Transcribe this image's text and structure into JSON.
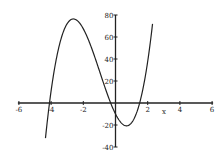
{
  "chart_data": {
    "type": "line",
    "title": "",
    "xlabel": "x",
    "ylabel": "",
    "xlim": [
      -6,
      6
    ],
    "ylim": [
      -40,
      80
    ],
    "grid": false,
    "legend": null,
    "x_ticks": [
      "-6",
      "-4",
      "-2",
      "0",
      "2",
      "4",
      "6"
    ],
    "y_ticks": [
      "-40",
      "-20",
      "20",
      "40",
      "60",
      "80"
    ],
    "series": [
      {
        "name": "f(x)",
        "description": "cubic with roots near x=-4.1, -0.3, 1.5; local max ~78 at x~-2.5; local min ~-23 at x~0.7",
        "x": [
          -4.35,
          -4.1,
          -3.5,
          -3.0,
          -2.5,
          -2.0,
          -1.5,
          -1.0,
          -0.5,
          -0.3,
          0.0,
          0.5,
          0.7,
          1.0,
          1.5,
          2.0,
          2.3
        ],
        "y": [
          -40,
          0,
          50,
          72,
          78,
          72,
          56,
          34,
          10,
          0,
          -10,
          -21,
          -23,
          -20,
          0,
          33,
          80
        ]
      }
    ]
  }
}
